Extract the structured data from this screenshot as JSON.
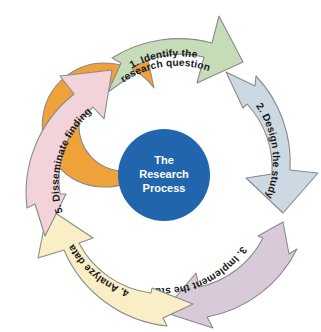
{
  "diagram": {
    "title": "The Research Process",
    "type": "circular-cycle",
    "background_color": "#ffffff",
    "hub": {
      "line1": "The",
      "line2": "Research",
      "line3": "Process",
      "fill_color": "#2166ad",
      "text_color": "#ffffff"
    },
    "outer_arrow": {
      "label": "Evidence-based practice",
      "fill_color": "#f0a23a",
      "text_color": "#ffffff",
      "outline_color": "#8a8a8a",
      "direction": "clockwise-return"
    },
    "steps": [
      {
        "number": "1.",
        "label": "1. Identify the research question",
        "line1": "1. Identify the",
        "line2": "research question",
        "fill_color": "#c6dcb9",
        "text_color": "#1a1a1a",
        "position": "top"
      },
      {
        "number": "2.",
        "label": "2. Design the study",
        "line1": "2. Design the study",
        "line2": "",
        "fill_color": "#ccd9e3",
        "text_color": "#1a1a1a",
        "position": "right"
      },
      {
        "number": "3.",
        "label": "3. Implement the study",
        "line1": "3. Implement the study",
        "line2": "",
        "fill_color": "#d9cada",
        "text_color": "#1a1a1a",
        "position": "bottom-right"
      },
      {
        "number": "4.",
        "label": "4. Analyze data",
        "line1": "4. Analyze data",
        "line2": "",
        "fill_color": "#faeec6",
        "text_color": "#1a1a1a",
        "position": "bottom-left"
      },
      {
        "number": "5.",
        "label": "5. Disseminate findings",
        "line1": "5. Disseminate findings",
        "line2": "",
        "fill_color": "#f2d3da",
        "text_color": "#1a1a1a",
        "position": "left"
      }
    ]
  }
}
